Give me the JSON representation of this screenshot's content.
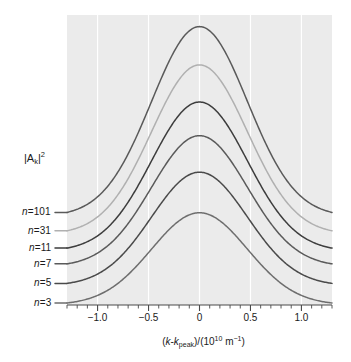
{
  "chart_data": {
    "type": "line",
    "title": "",
    "subtitle": "",
    "xlabel_parts": {
      "open": "(",
      "k1": "k",
      "minus": "-",
      "k2": "k",
      "k2sub": "peak",
      "close_div": ")/(10",
      "exp": "10",
      "unit": " m",
      "unit_exp": "−1",
      "tail": ")"
    },
    "xlabel_text": "(k-kpeak)/(10^10 m^-1)",
    "ylabel_parts": {
      "bar_open": "|A",
      "sub": "k",
      "bar_close": "|",
      "sup": "2"
    },
    "ylabel_text": "|Ak|^2",
    "xlim": [
      -1.3,
      1.3
    ],
    "ylim": [
      0,
      1.0
    ],
    "xticks": [
      -1.0,
      -0.5,
      0,
      0.5,
      1.0
    ],
    "xtick_labels": [
      "−1.0",
      "−0.5",
      "0",
      "0.5",
      "1.0"
    ],
    "xminor_step": 0.1,
    "yticks": [],
    "ytick_labels": [],
    "grid": "vertical-major-only",
    "grid_color": "#ffffff",
    "plot_bg": "#ebebeb",
    "legend_position": "left-of-axis-at-curve-baselines",
    "series": [
      {
        "name": "n=101",
        "label_prefix": "n",
        "label_eq": "=",
        "label_value": "101",
        "color": "#5a5a5a",
        "baseline": 0.305,
        "amplitude": 0.655,
        "sigma": 0.47,
        "label_y_frac": 0.305
      },
      {
        "name": "n=31",
        "label_prefix": "n",
        "label_eq": "=",
        "label_value": "31",
        "color": "#b0b0b0",
        "baseline": 0.243,
        "amplitude": 0.585,
        "sigma": 0.47,
        "label_y_frac": 0.243
      },
      {
        "name": "n=11",
        "label_prefix": "n",
        "label_eq": "=",
        "label_value": "11",
        "color": "#3d3d3d",
        "baseline": 0.185,
        "amplitude": 0.515,
        "sigma": 0.47,
        "label_y_frac": 0.185
      },
      {
        "name": "n=7",
        "label_prefix": "n",
        "label_eq": "=",
        "label_value": "7",
        "color": "#5a5a5a",
        "baseline": 0.132,
        "amplitude": 0.452,
        "sigma": 0.47,
        "label_y_frac": 0.132
      },
      {
        "name": "n=5",
        "label_prefix": "n",
        "label_eq": "=",
        "label_value": "5",
        "color": "#4a4a4a",
        "baseline": 0.066,
        "amplitude": 0.392,
        "sigma": 0.47,
        "label_y_frac": 0.066
      },
      {
        "name": "n=3",
        "label_prefix": "n",
        "label_eq": "=",
        "label_value": "3",
        "color": "#6e6e6e",
        "baseline": 0.0,
        "amplitude": 0.318,
        "sigma": 0.47,
        "label_y_frac": 0.0
      }
    ]
  }
}
